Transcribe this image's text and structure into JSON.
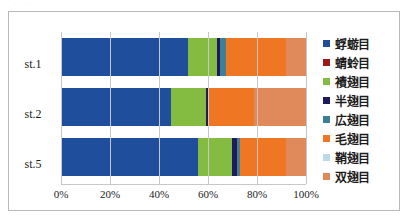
{
  "chart_data": {
    "type": "bar",
    "orientation": "horizontal",
    "stacked": true,
    "normalized": true,
    "title": "",
    "xlabel": "",
    "ylabel": "",
    "xlim": [
      0,
      100
    ],
    "xticks": [
      "0%",
      "20%",
      "40%",
      "60%",
      "80%",
      "100%"
    ],
    "xtick_values": [
      0,
      20,
      40,
      60,
      80,
      100
    ],
    "grid": true,
    "legend_position": "right",
    "categories": [
      "st.1",
      "st.2",
      "st.5"
    ],
    "series": [
      {
        "name": "蜉蝣目",
        "color": "#1f4e9c",
        "values": [
          52.0,
          45.0,
          56.0
        ]
      },
      {
        "name": "蜻蛉目",
        "color": "#9e1a18",
        "values": [
          0.0,
          0.0,
          0.0
        ]
      },
      {
        "name": "襀翅目",
        "color": "#84b font-weight",
        "values": [
          0,
          0,
          0
        ]
      },
      {
        "name": "半翅目",
        "color": "#1f1a5e",
        "values": [
          1.5,
          0.8,
          1.8
        ]
      },
      {
        "name": "広翅目",
        "color": "#3d7f96",
        "values": [
          2.5,
          0.0,
          1.2
        ]
      },
      {
        "name": "毛翅目",
        "color": "#ef7622",
        "values": [
          24.5,
          19.0,
          19.0
        ]
      },
      {
        "name": "鞘翅目",
        "color": "#bcd9e6",
        "values": [
          0.0,
          0.0,
          0.0
        ]
      },
      {
        "name": "双翅目",
        "color": "#e08a5c",
        "values": [
          8.0,
          21.2,
          8.0
        ]
      }
    ],
    "legend_entries": [
      "蜉蝣目",
      "蜻蛉目",
      "襀翅目",
      "半翅目",
      "広翅目",
      "毛翅目",
      "鞘翅目",
      "双翅目"
    ],
    "stack_order_per_category": {
      "st.1": [
        {
          "name": "蜉蝣目",
          "color": "#1f4e9c",
          "value": 52.0
        },
        {
          "name": "襀翅目",
          "color": "#84bc41",
          "value": 11.5
        },
        {
          "name": "半翅目",
          "color": "#1f1a5e",
          "value": 1.5
        },
        {
          "name": "広翅目",
          "color": "#3d7f96",
          "value": 2.5
        },
        {
          "name": "毛翅目",
          "color": "#ef7622",
          "value": 24.5
        },
        {
          "name": "双翅目",
          "color": "#e08a5c",
          "value": 8.0
        }
      ],
      "st.2": [
        {
          "name": "蜉蝣目",
          "color": "#1f4e9c",
          "value": 45.0
        },
        {
          "name": "襀翅目",
          "color": "#84bc41",
          "value": 14.0
        },
        {
          "name": "半翅目",
          "color": "#1f1a5e",
          "value": 0.8
        },
        {
          "name": "毛翅目",
          "color": "#ef7622",
          "value": 19.0
        },
        {
          "name": "双翅目",
          "color": "#e08a5c",
          "value": 21.2
        }
      ],
      "st.5": [
        {
          "name": "蜉蝣目",
          "color": "#1f4e9c",
          "value": 56.0
        },
        {
          "name": "襀翅目",
          "color": "#84bc41",
          "value": 14.0
        },
        {
          "name": "半翅目",
          "color": "#1f1a5e",
          "value": 1.8
        },
        {
          "name": "広翅目",
          "color": "#3d7f96",
          "value": 1.2
        },
        {
          "name": "毛翅目",
          "color": "#ef7622",
          "value": 19.0
        },
        {
          "name": "双翅目",
          "color": "#e08a5c",
          "value": 8.0
        }
      ]
    }
  },
  "legend": {
    "items": [
      {
        "label": "蜉蝣目",
        "color": "#1f4e9c"
      },
      {
        "label": "蜻蛉目",
        "color": "#9e1a18"
      },
      {
        "label": "襀翅目",
        "color": "#84bc41"
      },
      {
        "label": "半翅目",
        "color": "#1f1a5e"
      },
      {
        "label": "広翅目",
        "color": "#3d7f96"
      },
      {
        "label": "毛翅目",
        "color": "#ef7622"
      },
      {
        "label": "鞘翅目",
        "color": "#bcd9e6"
      },
      {
        "label": "双翅目",
        "color": "#e08a5c"
      }
    ]
  }
}
